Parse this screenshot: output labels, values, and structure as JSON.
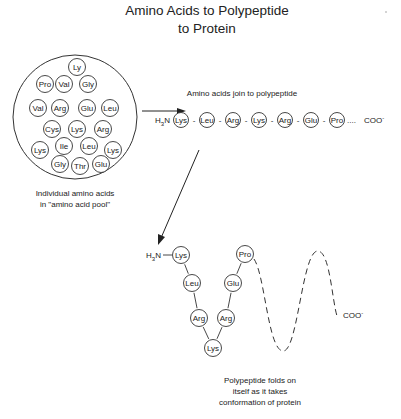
{
  "title": {
    "line1": "Amino Acids to Polypeptide",
    "line2": "to Protein"
  },
  "pool": {
    "caption_line1": "Individual amino acids",
    "caption_line2": "in \"amino acid pool\"",
    "acids": [
      {
        "label": "Ly",
        "x": 77,
        "y": 67
      },
      {
        "label": "Pro",
        "x": 45,
        "y": 84
      },
      {
        "label": "Val",
        "x": 64,
        "y": 84
      },
      {
        "label": "Gly",
        "x": 88,
        "y": 84
      },
      {
        "label": "Val",
        "x": 38,
        "y": 108
      },
      {
        "label": "Arg",
        "x": 60,
        "y": 108
      },
      {
        "label": "Glu",
        "x": 87,
        "y": 108
      },
      {
        "label": "Leu",
        "x": 110,
        "y": 108
      },
      {
        "label": "Cys",
        "x": 52,
        "y": 129
      },
      {
        "label": "Lys",
        "x": 77,
        "y": 129
      },
      {
        "label": "Arg",
        "x": 103,
        "y": 129
      },
      {
        "label": "Lys",
        "x": 40,
        "y": 150
      },
      {
        "label": "Ile",
        "x": 64,
        "y": 146
      },
      {
        "label": "Leu",
        "x": 89,
        "y": 146
      },
      {
        "label": "Lys",
        "x": 113,
        "y": 150
      },
      {
        "label": "Gly",
        "x": 60,
        "y": 164
      },
      {
        "label": "Thr",
        "x": 80,
        "y": 166
      },
      {
        "label": "Glu",
        "x": 101,
        "y": 164
      }
    ]
  },
  "chain": {
    "label": "Amino acids join to polypeptide",
    "n_terminus": "H3N",
    "c_terminus": "COO-",
    "ellipsis": "....",
    "acids": [
      "Lys",
      "Leu",
      "Arg",
      "Lys",
      "Arg",
      "Glu",
      "Pro"
    ]
  },
  "folded": {
    "n_terminus": "H3N",
    "c_terminus": "COO-",
    "caption_line1": "Polypeptide folds on",
    "caption_line2": "itself as it takes",
    "caption_line3": "conformation of protein",
    "acids": [
      {
        "label": "Lys",
        "x": 181,
        "y": 255
      },
      {
        "label": "Leu",
        "x": 192,
        "y": 283
      },
      {
        "label": "Arg",
        "x": 199,
        "y": 318
      },
      {
        "label": "Lys",
        "x": 213,
        "y": 348
      },
      {
        "label": "Arg",
        "x": 226,
        "y": 318
      },
      {
        "label": "Glu",
        "x": 233,
        "y": 283
      },
      {
        "label": "Pro",
        "x": 245,
        "y": 254
      }
    ]
  }
}
